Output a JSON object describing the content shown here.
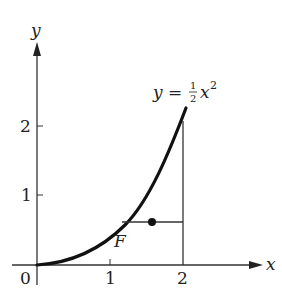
{
  "diagram": {
    "axes": {
      "x_label": "x",
      "y_label": "y",
      "origin_label": "0",
      "x_ticks": [
        "1",
        "2"
      ],
      "y_ticks": [
        "1",
        "2"
      ]
    },
    "curve": {
      "equation_lhs": "y = ",
      "equation_num": "1",
      "equation_den": "2",
      "equation_var": "x",
      "equation_exp": "2",
      "function": "y = (1/2) x^2",
      "domain": [
        0,
        2.05
      ]
    },
    "region_label": "F",
    "segment": {
      "y_value": 0.62,
      "from_x": 1.11,
      "to_x": 2,
      "dot_x": 1.57
    },
    "vertical_line": {
      "x": 2,
      "from_y": 0,
      "to_y": 2
    },
    "colors": {
      "ink": "#222222",
      "background": "#ffffff"
    }
  }
}
